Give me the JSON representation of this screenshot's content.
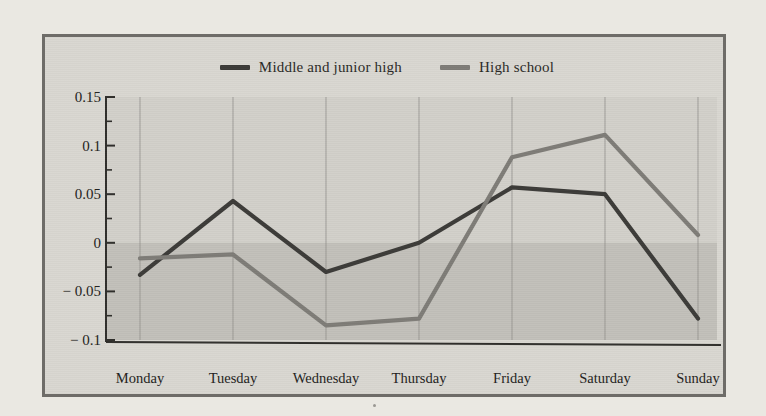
{
  "chart_data": {
    "type": "line",
    "title": "",
    "subtitle": "",
    "xlabel": "",
    "ylabel": "",
    "categories": [
      "Monday",
      "Tuesday",
      "Wednesday",
      "Thursday",
      "Friday",
      "Saturday",
      "Sunday"
    ],
    "series": [
      {
        "name": "Middle and junior high",
        "color": "#3c3b38",
        "values": [
          -0.033,
          0.043,
          -0.03,
          0.0,
          0.057,
          0.05,
          -0.078
        ]
      },
      {
        "name": "High school",
        "color": "#7e7c77",
        "values": [
          -0.016,
          -0.012,
          -0.085,
          -0.078,
          0.088,
          0.111,
          0.008
        ]
      }
    ],
    "ylim": [
      -0.1,
      0.15
    ],
    "yticks": [
      0.15,
      0.1,
      0.05,
      0,
      -0.05,
      -0.1
    ],
    "ytick_labels": [
      "0.15",
      "0.1",
      "0.05",
      "0",
      "− 0.05",
      "− 0.1"
    ],
    "yminor_step": 0.025,
    "grid": "vertical-only",
    "zero_band_shading": true,
    "legend_position": "top-center",
    "xtick_labels": [
      "Monday",
      "Tuesday",
      "Wednesday",
      "Thursday",
      "Friday",
      "Saturday",
      "Sunday"
    ]
  },
  "legend": {
    "items": [
      {
        "label": "Middle and junior high",
        "color": "#3c3b38"
      },
      {
        "label": "High school",
        "color": "#7e7c77"
      }
    ]
  },
  "colors": {
    "page_background": "#eae8e2",
    "frame_border": "#6e6c68",
    "plot_background": "#d9d7d1",
    "plot_upper_band": "#d2d0ca",
    "plot_lower_band": "#c2c0ba",
    "gridline": "#8f8d88",
    "axis": "#2f2e2b",
    "series_dark": "#3c3b38",
    "series_gray": "#7e7c77",
    "text": "#232220"
  }
}
